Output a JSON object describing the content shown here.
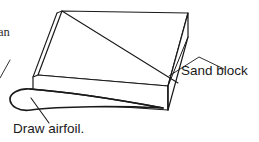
{
  "figure": {
    "type": "line-drawing",
    "width": 259,
    "height": 142,
    "background_color": "#ffffff",
    "line_color": "#1a1a1a"
  },
  "clipped_text": {
    "value": "an"
  },
  "labels": {
    "sand_block": "Sand block",
    "draw_airfoil": "Draw airfoil."
  },
  "diagram_data": {
    "type": "technical-line-drawing",
    "shapes": [
      {
        "name": "block-top-face",
        "kind": "polygon",
        "points": "62,11 188,13 168,86 38,75"
      },
      {
        "name": "block-front-face",
        "kind": "polygon",
        "points": "38,75 168,86 168,110 38,103"
      },
      {
        "name": "block-right-face",
        "kind": "polygon",
        "points": "168,86 188,13 188,37 168,110"
      },
      {
        "name": "block-left-sliver",
        "kind": "polyline",
        "points": "57,13 33,77"
      },
      {
        "name": "airfoil-outline",
        "kind": "path",
        "description": "rounded leading edge at left tapering to trailing point at right"
      }
    ],
    "leaders": [
      {
        "name": "sand-block-leader",
        "from": "168,76",
        "via": "198,58",
        "to": "224,70"
      },
      {
        "name": "draw-airfoil-leader",
        "from": "33,100",
        "to": "48,122"
      }
    ]
  }
}
